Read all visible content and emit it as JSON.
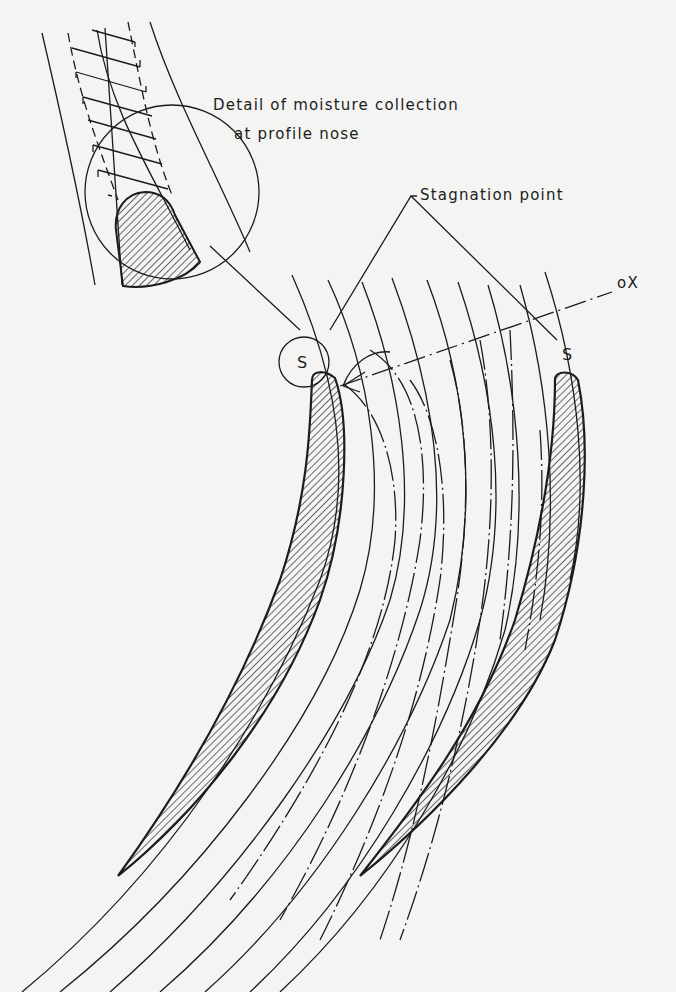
{
  "diagram": {
    "labels": {
      "detail_line1": "Detail of moisture collection",
      "detail_line2": "at profile nose",
      "stagnation": "Stagnation point",
      "axis": "oX",
      "s_left": "S",
      "s_right": "S"
    },
    "colors": {
      "background": "#f4f4f2",
      "ink": "#1c1c1c"
    }
  }
}
